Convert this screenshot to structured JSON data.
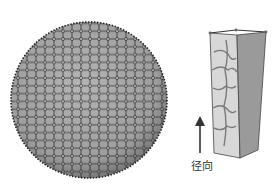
{
  "figure": {
    "left_panel": {
      "description": "Spherical Voronoi tessellation (hexagonal cell mesh on a sphere)",
      "fill_color": "#a9a9a9",
      "edge_color": "#2a2a2a"
    },
    "right_panel": {
      "description": "Single columnar cell extracted from the sphere, shown as a tapered prism with textured wall",
      "light_face_color": "#d6d6d6",
      "dark_face_color": "#8f8f8f"
    },
    "arrow": {
      "direction": "up",
      "label": "径向"
    }
  }
}
